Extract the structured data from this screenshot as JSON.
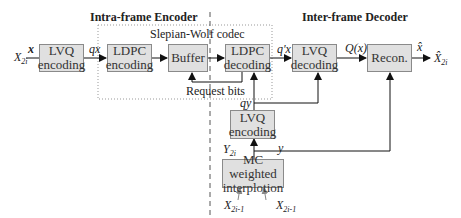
{
  "headings": {
    "encoder": "Intra-frame Encoder",
    "decoder": "Inter-frame Decoder",
    "codec": "Slepian-Wolf codec"
  },
  "blocks": {
    "lvq_encoding": [
      "LVQ",
      "encoding"
    ],
    "ldpc_encoding": [
      "LDPC",
      "encoding"
    ],
    "buffer": "Buffer",
    "ldpc_decoding": [
      "LDPC",
      "decoding"
    ],
    "lvq_decoding": [
      "LVQ",
      "decoding"
    ],
    "recon": "Recon.",
    "lvq_encoding_side": [
      "LVQ",
      "encoding"
    ],
    "mc_interp": [
      "MC weighted",
      "interplotion"
    ]
  },
  "signals": {
    "input": "X",
    "input_sub": "2i",
    "x": "x",
    "qx": "qx",
    "qprime_x": "q'x",
    "Qx": "Q(x)",
    "xhat": "x̂",
    "output": "X̂",
    "output_sub": "2i",
    "request_bits": "Request bits",
    "qy": "qy",
    "y": "y",
    "Y": "Y",
    "Y_sub": "2i",
    "ref1": "X",
    "ref1_sub": "2i-1",
    "ref2": "X",
    "ref2_sub": "2i-1"
  }
}
